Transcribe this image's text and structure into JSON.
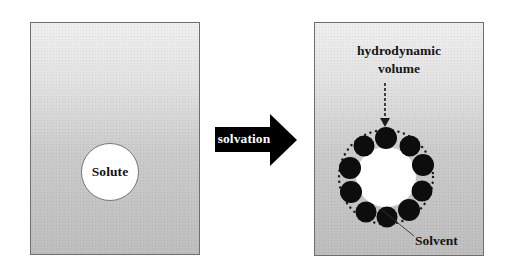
{
  "diagram": {
    "type": "solvation-schematic",
    "left_panel": {
      "solute_label": "Solute"
    },
    "arrow": {
      "label": "solvation",
      "direction": "right",
      "color": "#000000"
    },
    "right_panel": {
      "hydrodynamic_label_line1": "hydrodynamic",
      "hydrodynamic_label_line2": "volume",
      "solvent_label": "Solvent",
      "solvent_molecule_count": 10,
      "solvent_molecule_color": "#000000",
      "boundary_style": "dotted-circle"
    },
    "colors": {
      "panel_border": "#6e6e6e",
      "panel_fill_top": "#efefef",
      "panel_fill_bottom": "#bdbdbd",
      "solute_fill": "#ffffff",
      "text": "#151515"
    }
  }
}
